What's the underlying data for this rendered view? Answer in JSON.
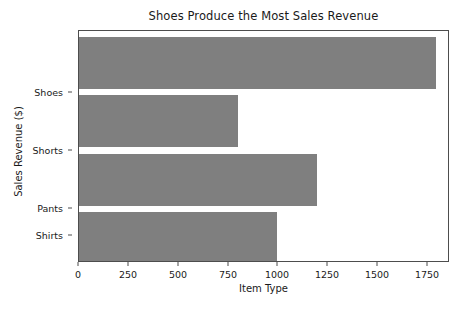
{
  "chart_data": {
    "type": "bar",
    "orientation": "horizontal",
    "title": "Shoes Produce the Most Sales Revenue",
    "xlabel": "Item Type",
    "ylabel": "Sales Revenue ($)",
    "categories": [
      "Shirts",
      "Pants",
      "Shorts",
      "Shoes"
    ],
    "values": [
      1000,
      1200,
      800,
      1800
    ],
    "bars": [
      {
        "category": "Shoes",
        "value": 1800
      },
      {
        "category": "Shorts",
        "value": 800
      },
      {
        "category": "Pants",
        "value": 1200
      },
      {
        "category": "Shirts",
        "value": 1000
      }
    ],
    "xticks": [
      0,
      250,
      500,
      750,
      1000,
      1250,
      1500,
      1750
    ],
    "xticklabels": [
      "0",
      "250",
      "500",
      "750",
      "1000",
      "1250",
      "1500",
      "1750"
    ],
    "yticklabels": [
      "Shoes",
      "Shorts",
      "Pants",
      "Shirts"
    ],
    "xlim": [
      0,
      1860
    ],
    "grid": false,
    "legend": null,
    "bar_color": "#7f7f7f",
    "background_color": "#ffffff",
    "axis_color": "#4d4d4d"
  }
}
